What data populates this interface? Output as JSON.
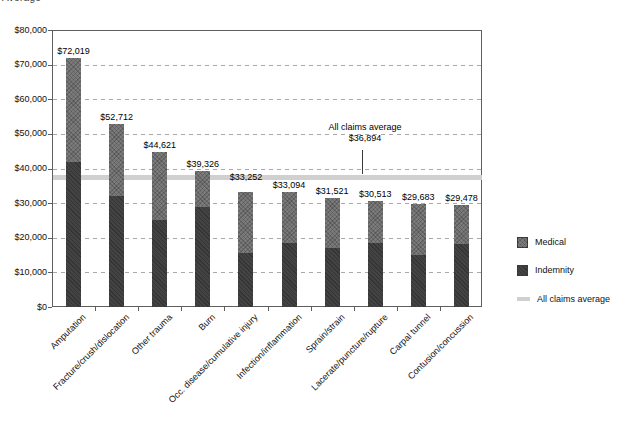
{
  "header": {
    "partial_title": "Average"
  },
  "chart_data": {
    "type": "bar",
    "stacked": true,
    "categories": [
      "Amputation",
      "Fracture/crush/dislocation",
      "Other trauma",
      "Burn",
      "Occ. disease/cumulative injury",
      "Infection/inflammation",
      "Sprain/strain",
      "Lacerate/puncture/rupture",
      "Carpal tunnel",
      "Contusion/concussion"
    ],
    "series": [
      {
        "name": "Indemnity",
        "color": "#434343",
        "values": [
          42000,
          32200,
          25100,
          29000,
          15500,
          18400,
          17000,
          18600,
          15000,
          18100
        ]
      },
      {
        "name": "Medical",
        "color": "#7b7b7b",
        "values": [
          30019,
          20512,
          19521,
          10326,
          17752,
          14694,
          14521,
          11913,
          14683,
          11378
        ]
      }
    ],
    "totals": [
      72019,
      52712,
      44621,
      39326,
      33252,
      33094,
      31521,
      30513,
      29683,
      29478
    ],
    "total_labels": [
      "$72,019",
      "$52,712",
      "$44,621",
      "$39,326",
      "$33,252",
      "$33,094",
      "$31,521",
      "$30,513",
      "$29,683",
      "$29,478"
    ],
    "y_axis": {
      "min": 0,
      "max": 80000,
      "tick_step": 10000,
      "gridlines": "dashed",
      "tick_labels": [
        "$0",
        "$10,000",
        "$20,000",
        "$30,000",
        "$40,000",
        "$50,000",
        "$60,000",
        "$70,000",
        "$80,000"
      ]
    },
    "average_line": {
      "label": "All claims average",
      "value_label": "$36,894",
      "value": 36894,
      "color": "#d0d0d0"
    },
    "legend": {
      "position": "right",
      "items": [
        {
          "label": "Medical",
          "swatch": "square",
          "color": "#7b7b7b"
        },
        {
          "label": "Indemnity",
          "swatch": "square",
          "color": "#434343"
        },
        {
          "label": "All claims average",
          "swatch": "bar",
          "color": "#d0d0d0"
        }
      ]
    }
  }
}
